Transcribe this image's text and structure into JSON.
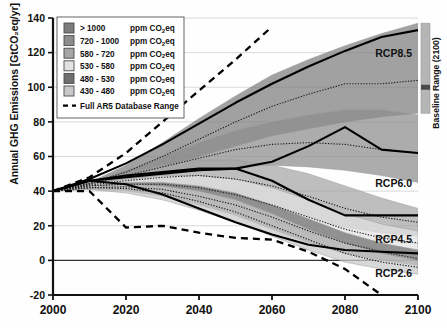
{
  "figure": {
    "y_axis_title": "Annual GHG Emissions [GtCO₂eq/yr]",
    "baseline_bar_label": "Baseline Range (2100)"
  },
  "legend": {
    "items": [
      {
        "label": "> 1000",
        "unit": "ppm CO₂eq",
        "color": "#7d7d7d"
      },
      {
        "label": "720 - 1000",
        "unit": "ppm CO₂eq",
        "color": "#8c8c8c"
      },
      {
        "label": "580 - 720",
        "unit": "ppm CO₂eq",
        "color": "#a5a5a5"
      },
      {
        "label": "530 - 580",
        "unit": "ppm CO₂eq",
        "color": "#e2e2e2"
      },
      {
        "label": "480 - 530",
        "unit": "ppm CO₂eq",
        "color": "#6f6f6f"
      },
      {
        "label": "430 - 480",
        "unit": "ppm CO₂eq",
        "color": "#c9c9c9"
      }
    ],
    "dashed_label": "Full AR5 Database Range"
  },
  "annotations": {
    "rcp85": "RCP8.5",
    "rcp60": "RCP6.0",
    "rcp45": "RCP4.5",
    "rcp26": "RCP2.6"
  },
  "chart_data": {
    "type": "area",
    "title": "",
    "xlabel": "",
    "ylabel": "Annual GHG Emissions [GtCO₂eq/yr]",
    "xlim": [
      2000,
      2100
    ],
    "ylim": [
      -20,
      140
    ],
    "xticks": [
      2000,
      2020,
      2040,
      2060,
      2080,
      2100
    ],
    "yticks": [
      -20,
      0,
      20,
      40,
      60,
      80,
      100,
      120,
      140
    ],
    "grid": "horizontal",
    "legend_position": "top-left",
    "x": [
      2000,
      2010,
      2020,
      2030,
      2040,
      2050,
      2060,
      2070,
      2080,
      2090,
      2100
    ],
    "bands": [
      {
        "name": "> 1000 ppm CO2eq",
        "color": "#7d7d7d",
        "upper": [
          40,
          45,
          55,
          68,
          82,
          95,
          107,
          116,
          124,
          131,
          137
        ],
        "lower": [
          40,
          44,
          48,
          54,
          60,
          66,
          72,
          76,
          80,
          83,
          85
        ],
        "median": [
          40,
          44.5,
          51,
          60,
          70,
          80,
          89,
          96,
          102,
          102,
          104
        ]
      },
      {
        "name": "720 - 1000 ppm CO2eq",
        "color": "#8c8c8c",
        "upper": [
          40,
          45,
          52,
          60,
          68,
          75,
          80,
          84,
          87,
          87,
          84
        ],
        "lower": [
          40,
          43,
          46,
          49,
          52,
          54,
          55,
          54,
          52,
          49,
          45
        ],
        "median": [
          40,
          44,
          49,
          54,
          59,
          64,
          67,
          68,
          67,
          64,
          62
        ]
      },
      {
        "name": "580 - 720 ppm CO2eq",
        "color": "#a5a5a5",
        "upper": [
          40,
          45,
          50,
          55,
          58,
          58,
          55,
          50,
          43,
          36,
          30
        ],
        "lower": [
          40,
          42,
          43,
          43,
          41,
          37,
          31,
          25,
          19,
          16,
          14
        ],
        "median": [
          40,
          43.5,
          46,
          48,
          49,
          47,
          43,
          37,
          30,
          25,
          22
        ]
      },
      {
        "name": "530 - 580 ppm CO2eq",
        "color": "#e2e2e2",
        "upper": [
          40,
          44,
          47,
          49,
          49,
          47,
          42,
          35,
          27,
          21,
          17
        ],
        "lower": [
          40,
          42,
          41,
          39,
          35,
          30,
          23,
          16,
          10,
          6,
          4
        ],
        "median": [
          40,
          43,
          44,
          44,
          42,
          38,
          32,
          25,
          18,
          13,
          10
        ]
      },
      {
        "name": "480 - 530 ppm CO2eq",
        "color": "#6f6f6f",
        "upper": [
          40,
          43,
          45,
          45,
          43,
          39,
          32,
          24,
          16,
          10,
          6
        ],
        "lower": [
          40,
          41,
          40,
          37,
          32,
          26,
          18,
          10,
          4,
          0,
          -3
        ],
        "median": [
          40,
          42,
          42.5,
          41,
          37,
          32,
          25,
          17,
          10,
          5,
          1
        ]
      },
      {
        "name": "430 - 480 ppm CO2eq",
        "color": "#c9c9c9",
        "upper": [
          40,
          43,
          44,
          43,
          40,
          35,
          27,
          18,
          10,
          4,
          0
        ],
        "lower": [
          40,
          41,
          39,
          35,
          29,
          22,
          14,
          6,
          -1,
          -5,
          -8
        ],
        "median": [
          40,
          42,
          41.5,
          39,
          34,
          28,
          20,
          12,
          4,
          -1,
          -4
        ]
      }
    ],
    "rcp_lines": [
      {
        "name": "RCP8.5",
        "values": [
          40,
          47,
          56,
          67,
          79,
          91,
          102,
          112,
          121,
          129,
          133
        ]
      },
      {
        "name": "RCP6.0",
        "values": [
          40,
          46,
          48,
          50,
          52,
          53,
          57,
          66,
          77,
          64,
          62
        ]
      },
      {
        "name": "RCP4.5",
        "values": [
          40,
          46,
          49,
          51,
          53,
          53,
          46,
          35,
          26,
          26,
          26
        ]
      },
      {
        "name": "RCP2.6",
        "values": [
          40,
          46,
          44,
          38,
          30,
          22,
          15,
          9,
          6,
          5,
          4
        ]
      }
    ],
    "full_range_dashed": {
      "name": "Full AR5 Database Range",
      "upper": [
        40,
        48,
        62,
        80,
        98,
        116,
        135,
        null,
        null,
        null,
        null
      ],
      "lower": [
        40,
        40,
        19,
        20,
        16,
        13,
        12,
        5,
        -5,
        -20,
        null
      ]
    },
    "baseline_range_2100": {
      "min": 85,
      "max": 137,
      "marker": 100
    }
  }
}
